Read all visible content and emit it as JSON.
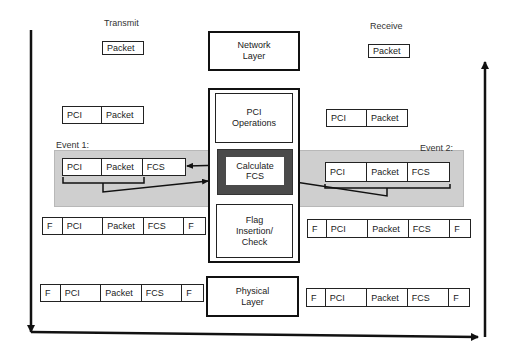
{
  "labels": {
    "transmit": "Transmit",
    "receive": "Receive",
    "event1": "Event 1:",
    "event2": "Event 2:"
  },
  "center_stack": {
    "network_layer": "Network\nLayer",
    "pci_operations": "PCI\nOperations",
    "calculate_fcs": "Calculate\nFCS",
    "flag_insertion": "Flag\nInsertion/\nCheck",
    "physical_layer": "Physical\nLayer"
  },
  "transmit_side": {
    "packet": [
      "Packet"
    ],
    "pci_packet": [
      "PCI",
      "Packet"
    ],
    "event_frame": [
      "PCI",
      "Packet",
      "FCS"
    ],
    "flagged_frame": [
      "F",
      "PCI",
      "Packet",
      "FCS",
      "F"
    ],
    "physical_frame": [
      "F",
      "PCI",
      "Packet",
      "FCS",
      "F"
    ]
  },
  "receive_side": {
    "packet": [
      "Packet"
    ],
    "pci_packet": [
      "PCI",
      "Packet"
    ],
    "event_frame": [
      "PCI",
      "Packet",
      "FCS"
    ],
    "flagged_frame": [
      "F",
      "PCI",
      "Packet",
      "FCS",
      "F"
    ],
    "physical_frame": [
      "F",
      "PCI",
      "Packet",
      "FCS",
      "F"
    ]
  },
  "colors": {
    "event_band": "#cfcfcf",
    "calc_fcs_surround": "#4a4a4a",
    "line": "#111111"
  }
}
